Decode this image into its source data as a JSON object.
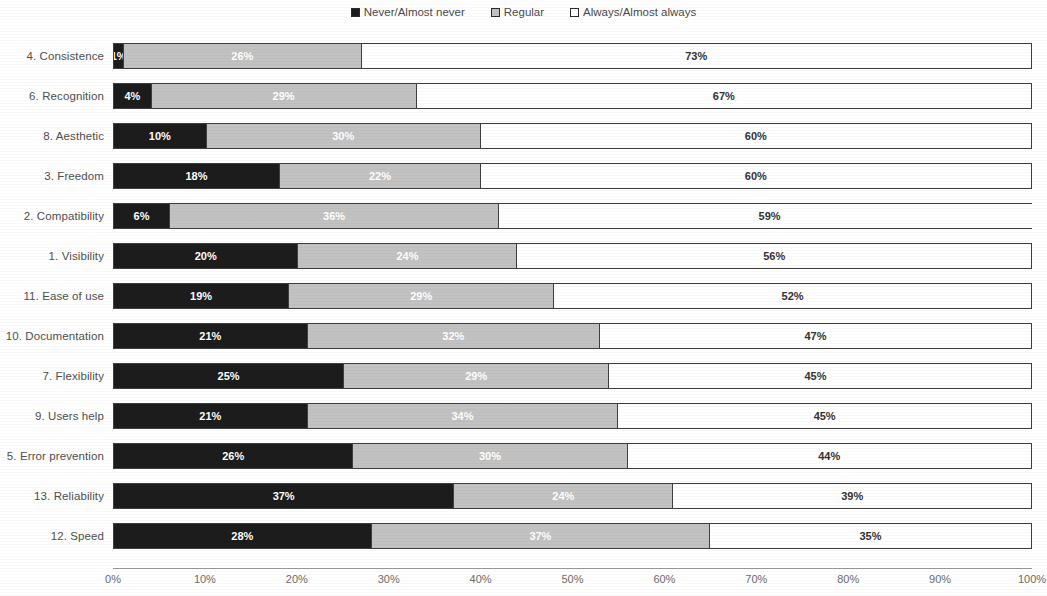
{
  "legend": {
    "position": "top-center",
    "items": [
      {
        "label": "Never/Almost never",
        "color": "#1c1c1c",
        "key": "never"
      },
      {
        "label": "Regular",
        "color": "#c2c2c2",
        "key": "regular"
      },
      {
        "label": "Always/Almost always",
        "color": "#ffffff",
        "key": "always"
      }
    ]
  },
  "axis": {
    "ticks": [
      "0%",
      "10%",
      "20%",
      "30%",
      "40%",
      "50%",
      "60%",
      "70%",
      "80%",
      "90%",
      "100%"
    ]
  },
  "chart_data": {
    "type": "bar",
    "orientation": "horizontal",
    "stacked": true,
    "stack_mode": "percent",
    "title": "",
    "subtitle": "",
    "xlabel": "",
    "ylabel": "",
    "xlim": [
      0,
      100
    ],
    "xticks": [
      0,
      10,
      20,
      30,
      40,
      50,
      60,
      70,
      80,
      90,
      100
    ],
    "xticklabels": [
      "0%",
      "10%",
      "20%",
      "30%",
      "40%",
      "50%",
      "60%",
      "70%",
      "80%",
      "90%",
      "100%"
    ],
    "grid": false,
    "legend_position": "top-center",
    "categories": [
      "4. Consistence",
      "6. Recognition",
      "8. Aesthetic",
      "3. Freedom",
      "2. Compatibility",
      "1. Visibility",
      "11. Ease of use",
      "10. Documentation",
      "7. Flexibility",
      "9. Users help",
      "5. Error prevention",
      "13. Reliability",
      "12. Speed"
    ],
    "series": [
      {
        "name": "Never/Almost never",
        "color": "#1c1c1c",
        "values": [
          1,
          4,
          10,
          18,
          6,
          20,
          19,
          21,
          25,
          21,
          26,
          37,
          28
        ],
        "labels": [
          "1%",
          "4%",
          "10%",
          "18%",
          "6%",
          "20%",
          "19%",
          "21%",
          "25%",
          "21%",
          "26%",
          "37%",
          "28%"
        ]
      },
      {
        "name": "Regular",
        "color": "#c2c2c2",
        "values": [
          26,
          29,
          30,
          22,
          36,
          24,
          29,
          32,
          29,
          34,
          30,
          24,
          37
        ],
        "labels": [
          "26%",
          "29%",
          "30%",
          "22%",
          "36%",
          "24%",
          "29%",
          "32%",
          "29%",
          "34%",
          "30%",
          "24%",
          "37%"
        ]
      },
      {
        "name": "Always/Almost always",
        "color": "#ffffff",
        "values": [
          73,
          67,
          60,
          60,
          59,
          56,
          52,
          47,
          45,
          45,
          44,
          39,
          35
        ],
        "labels": [
          "73%",
          "67%",
          "60%",
          "60%",
          "59%",
          "56%",
          "52%",
          "47%",
          "45%",
          "45%",
          "44%",
          "39%",
          "35%"
        ]
      }
    ]
  }
}
